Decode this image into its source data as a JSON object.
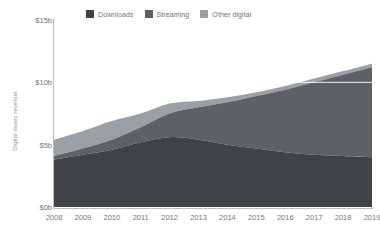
{
  "chart_data": {
    "type": "area",
    "title": "",
    "subtitle": "",
    "xlabel": "",
    "ylabel": "Digital music revenue",
    "stacked": true,
    "grid": false,
    "legend_position": "top",
    "categories": [
      "2008",
      "2009",
      "2010",
      "2011",
      "2012",
      "2013",
      "2014",
      "2015",
      "2016",
      "2017",
      "2018",
      "2019"
    ],
    "x": [
      2008,
      2009,
      2010,
      2011,
      2012,
      2013,
      2014,
      2015,
      2016,
      2017,
      2018,
      2019
    ],
    "ylim": [
      0,
      15
    ],
    "y_unit": "b",
    "y_prefix": "$",
    "yticks": [
      0,
      5,
      10,
      15
    ],
    "ytick_labels": [
      "$0b",
      "$5b",
      "$10b",
      "$15b"
    ],
    "series": [
      {
        "name": "Downloads",
        "color": "#3f4347",
        "values": [
          3.8,
          4.2,
          4.6,
          5.2,
          5.6,
          5.4,
          5.0,
          4.7,
          4.4,
          4.2,
          4.1,
          4.0
        ]
      },
      {
        "name": "Streaming",
        "color": "#5d6165",
        "values": [
          0.3,
          0.5,
          0.8,
          1.2,
          1.9,
          2.6,
          3.4,
          4.2,
          5.0,
          5.8,
          6.5,
          7.2
        ]
      },
      {
        "name": "Other digital",
        "color": "#9ba0a4",
        "values": [
          1.3,
          1.4,
          1.5,
          1.1,
          0.8,
          0.5,
          0.4,
          0.3,
          0.3,
          0.3,
          0.3,
          0.3
        ]
      }
    ],
    "totals": [
      5.4,
      6.1,
      6.9,
      7.5,
      8.3,
      8.5,
      8.8,
      9.2,
      9.7,
      10.3,
      10.9,
      11.5
    ]
  },
  "legend": {
    "items": [
      {
        "label": "Downloads",
        "color": "#3f4347"
      },
      {
        "label": "Streaming",
        "color": "#5d6165"
      },
      {
        "label": "Other digital",
        "color": "#9ba0a4"
      }
    ]
  },
  "axes": {
    "y_title": "Digital music revenue",
    "y_tick_labels": [
      "$15b",
      "$10b",
      "$5b",
      "$0b"
    ],
    "x_tick_labels": [
      "2008",
      "2009",
      "2010",
      "2011",
      "2012",
      "2013",
      "2014",
      "2015",
      "2016",
      "2017",
      "2018",
      "2019"
    ]
  },
  "colors": {
    "axis": "#b9bdc1",
    "text": "#72767a",
    "background": "#ffffff",
    "gridline": "#ffffff"
  }
}
